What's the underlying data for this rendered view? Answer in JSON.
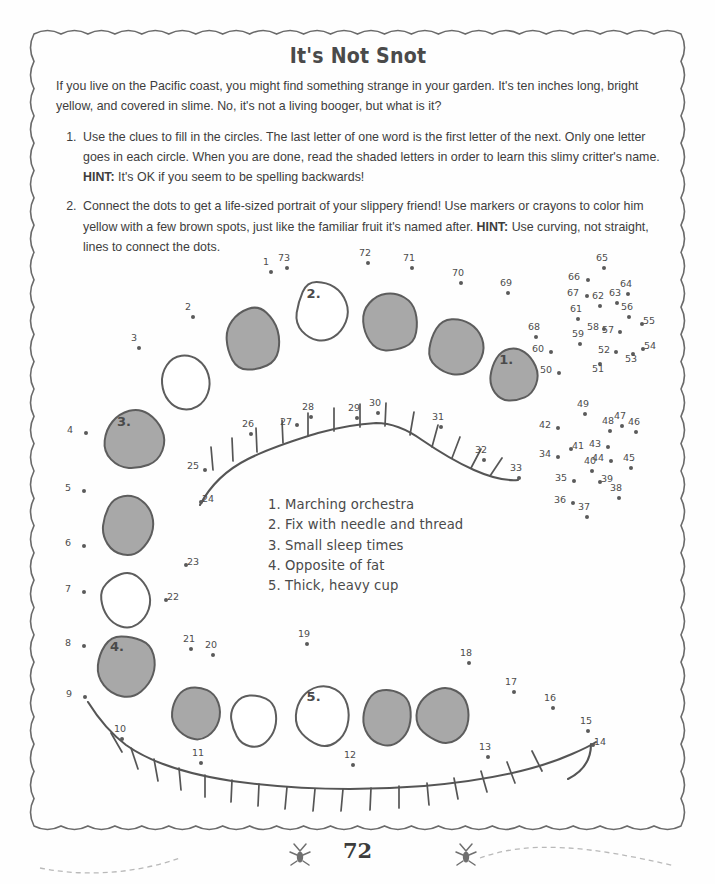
{
  "page": {
    "title": "It's Not Snot",
    "page_number": "72",
    "intro": "If you live on the Pacific coast, you might find something strange in your garden. It's ten inches long, bright yellow, and covered in slime. No, it's not a living booger, but what is it?",
    "instructions": [
      {
        "text_before_hint": "Use the clues to fill in the circles. The last letter of one word is the first letter of the next. Only one letter goes in each circle. When you are done, read the shaded letters in order to learn this slimy critter's name. ",
        "hint_label": "HINT:",
        "text_after_hint": " It's OK if you seem to be spelling backwards!"
      },
      {
        "text_before_hint": "Connect the dots to get a life-sized portrait of your slippery friend! Use markers or crayons to color him yellow with a few brown spots, just like the familiar fruit it's named after. ",
        "hint_label": "HINT:",
        "text_after_hint": " Use curving, not straight, lines to connect the dots."
      }
    ]
  },
  "clues": [
    "1. Marching orchestra",
    "2. Fix with needle and thread",
    "3. Small sleep times",
    "4. Opposite of fat",
    "5. Thick, heavy cup"
  ],
  "colors": {
    "ink": "#4a4a4a",
    "text": "#3d3d3d",
    "shaded_circle_fill": "#a8a8a8",
    "circle_stroke": "#5d5d5d",
    "dot": "#5a5a5a",
    "border": "#6a6a6a"
  },
  "circle_chain": [
    {
      "id": "c-top-1",
      "label": "",
      "shaded": true,
      "cx": 253,
      "cy": 340,
      "rx": 30,
      "ry": 33,
      "rot": -6
    },
    {
      "id": "c-top-2",
      "label": "2.",
      "shaded": false,
      "cx": 322,
      "cy": 312,
      "rx": 28,
      "ry": 33,
      "rot": 4
    },
    {
      "id": "c-top-3",
      "label": "",
      "shaded": true,
      "cx": 391,
      "cy": 322,
      "rx": 30,
      "ry": 32,
      "rot": -3
    },
    {
      "id": "c-top-4",
      "label": "",
      "shaded": true,
      "cx": 457,
      "cy": 348,
      "rx": 29,
      "ry": 31,
      "rot": 6
    },
    {
      "id": "c-top-5",
      "label": "1.",
      "shaded": true,
      "cx": 513,
      "cy": 375,
      "rx": 25,
      "ry": 29,
      "rot": -4
    },
    {
      "id": "c-left-1",
      "label": "",
      "shaded": false,
      "cx": 186,
      "cy": 384,
      "rx": 26,
      "ry": 30,
      "rot": 3
    },
    {
      "id": "c-left-2",
      "label": "3.",
      "shaded": true,
      "cx": 134,
      "cy": 440,
      "rx": 31,
      "ry": 32,
      "rot": -5
    },
    {
      "id": "c-left-3",
      "label": "",
      "shaded": true,
      "cx": 128,
      "cy": 525,
      "rx": 28,
      "ry": 30,
      "rot": 5
    },
    {
      "id": "c-left-4",
      "label": "",
      "shaded": false,
      "cx": 125,
      "cy": 600,
      "rx": 26,
      "ry": 28,
      "rot": -3
    },
    {
      "id": "c-left-5",
      "label": "4.",
      "shaded": true,
      "cx": 127,
      "cy": 665,
      "rx": 31,
      "ry": 32,
      "rot": 4
    },
    {
      "id": "c-bot-1",
      "label": "",
      "shaded": true,
      "cx": 195,
      "cy": 712,
      "rx": 26,
      "ry": 28,
      "rot": -4
    },
    {
      "id": "c-bot-2",
      "label": "",
      "shaded": false,
      "cx": 254,
      "cy": 720,
      "rx": 25,
      "ry": 27,
      "rot": 3
    },
    {
      "id": "c-bot-3",
      "label": "5.",
      "shaded": false,
      "cx": 322,
      "cy": 715,
      "rx": 28,
      "ry": 32,
      "rot": -5
    },
    {
      "id": "c-bot-4",
      "label": "",
      "shaded": true,
      "cx": 387,
      "cy": 717,
      "rx": 27,
      "ry": 29,
      "rot": 4
    },
    {
      "id": "c-bot-5",
      "label": "",
      "shaded": true,
      "cx": 443,
      "cy": 715,
      "rx": 27,
      "ry": 29,
      "rot": -3
    }
  ],
  "dots": [
    {
      "n": "1",
      "x": 271,
      "y": 272,
      "lx": -4,
      "ly": -12
    },
    {
      "n": "2",
      "x": 193,
      "y": 317,
      "lx": -4,
      "ly": -12
    },
    {
      "n": "3",
      "x": 139,
      "y": 348,
      "lx": -4,
      "ly": -12
    },
    {
      "n": "4",
      "x": 86,
      "y": 433,
      "lx": -15,
      "ly": -5
    },
    {
      "n": "5",
      "x": 84,
      "y": 491,
      "lx": -15,
      "ly": -5
    },
    {
      "n": "6",
      "x": 84,
      "y": 546,
      "lx": -15,
      "ly": -5
    },
    {
      "n": "7",
      "x": 84,
      "y": 592,
      "lx": -15,
      "ly": -5
    },
    {
      "n": "8",
      "x": 84,
      "y": 646,
      "lx": -15,
      "ly": -5
    },
    {
      "n": "9",
      "x": 85,
      "y": 697,
      "lx": -15,
      "ly": -5
    },
    {
      "n": "10",
      "x": 122,
      "y": 739,
      "lx": -4,
      "ly": -12
    },
    {
      "n": "11",
      "x": 201,
      "y": 763,
      "lx": -5,
      "ly": -12
    },
    {
      "n": "12",
      "x": 353,
      "y": 765,
      "lx": -5,
      "ly": -12
    },
    {
      "n": "13",
      "x": 488,
      "y": 757,
      "lx": -5,
      "ly": -12
    },
    {
      "n": "14",
      "x": 593,
      "y": 745,
      "lx": 5,
      "ly": -5
    },
    {
      "n": "15",
      "x": 588,
      "y": 731,
      "lx": -4,
      "ly": -12
    },
    {
      "n": "16",
      "x": 553,
      "y": 708,
      "lx": -5,
      "ly": -12
    },
    {
      "n": "17",
      "x": 514,
      "y": 692,
      "lx": -5,
      "ly": -12
    },
    {
      "n": "18",
      "x": 469,
      "y": 663,
      "lx": -5,
      "ly": -12
    },
    {
      "n": "19",
      "x": 307,
      "y": 644,
      "lx": -5,
      "ly": -12
    },
    {
      "n": "20",
      "x": 213,
      "y": 655,
      "lx": -4,
      "ly": -12
    },
    {
      "n": "21",
      "x": 191,
      "y": 649,
      "lx": -4,
      "ly": -12
    },
    {
      "n": "22",
      "x": 166,
      "y": 600,
      "lx": 5,
      "ly": -5
    },
    {
      "n": "23",
      "x": 186,
      "y": 565,
      "lx": 5,
      "ly": -5
    },
    {
      "n": "24",
      "x": 201,
      "y": 502,
      "lx": 5,
      "ly": -5
    },
    {
      "n": "25",
      "x": 205,
      "y": 470,
      "lx": -14,
      "ly": -6
    },
    {
      "n": "26",
      "x": 251,
      "y": 434,
      "lx": -5,
      "ly": -12
    },
    {
      "n": "27",
      "x": 297,
      "y": 425,
      "lx": -13,
      "ly": -5
    },
    {
      "n": "28",
      "x": 311,
      "y": 417,
      "lx": -5,
      "ly": -12
    },
    {
      "n": "29",
      "x": 357,
      "y": 418,
      "lx": -5,
      "ly": -12
    },
    {
      "n": "30",
      "x": 378,
      "y": 413,
      "lx": -5,
      "ly": -12
    },
    {
      "n": "31",
      "x": 441,
      "y": 427,
      "lx": -5,
      "ly": -12
    },
    {
      "n": "32",
      "x": 484,
      "y": 460,
      "lx": -5,
      "ly": -12
    },
    {
      "n": "33",
      "x": 519,
      "y": 478,
      "lx": -5,
      "ly": -12
    },
    {
      "n": "34",
      "x": 558,
      "y": 457,
      "lx": -15,
      "ly": -5
    },
    {
      "n": "35",
      "x": 574,
      "y": 481,
      "lx": -15,
      "ly": -5
    },
    {
      "n": "36",
      "x": 573,
      "y": 503,
      "lx": -15,
      "ly": -5
    },
    {
      "n": "37",
      "x": 587,
      "y": 517,
      "lx": -5,
      "ly": -12
    },
    {
      "n": "38",
      "x": 619,
      "y": 498,
      "lx": -5,
      "ly": -12
    },
    {
      "n": "39",
      "x": 600,
      "y": 482,
      "lx": 5,
      "ly": -5
    },
    {
      "n": "40",
      "x": 592,
      "y": 471,
      "lx": -4,
      "ly": -12
    },
    {
      "n": "41",
      "x": 571,
      "y": 449,
      "lx": 5,
      "ly": -5
    },
    {
      "n": "42",
      "x": 558,
      "y": 428,
      "lx": -15,
      "ly": -5
    },
    {
      "n": "43",
      "x": 608,
      "y": 447,
      "lx": -15,
      "ly": -5
    },
    {
      "n": "44",
      "x": 611,
      "y": 461,
      "lx": -15,
      "ly": -5
    },
    {
      "n": "45",
      "x": 631,
      "y": 468,
      "lx": -4,
      "ly": -12
    },
    {
      "n": "46",
      "x": 636,
      "y": 432,
      "lx": -4,
      "ly": -12
    },
    {
      "n": "47",
      "x": 622,
      "y": 426,
      "lx": -4,
      "ly": -12
    },
    {
      "n": "48",
      "x": 610,
      "y": 431,
      "lx": -4,
      "ly": -12
    },
    {
      "n": "49",
      "x": 585,
      "y": 414,
      "lx": -4,
      "ly": -12
    },
    {
      "n": "50",
      "x": 559,
      "y": 373,
      "lx": -15,
      "ly": -5
    },
    {
      "n": "51",
      "x": 600,
      "y": 364,
      "lx": -4,
      "ly": 3
    },
    {
      "n": "52",
      "x": 616,
      "y": 352,
      "lx": -14,
      "ly": -4
    },
    {
      "n": "53",
      "x": 633,
      "y": 354,
      "lx": -4,
      "ly": 3
    },
    {
      "n": "54",
      "x": 643,
      "y": 349,
      "lx": 5,
      "ly": -5
    },
    {
      "n": "55",
      "x": 642,
      "y": 324,
      "lx": 5,
      "ly": -5
    },
    {
      "n": "56",
      "x": 629,
      "y": 317,
      "lx": -4,
      "ly": -12
    },
    {
      "n": "57",
      "x": 620,
      "y": 332,
      "lx": -14,
      "ly": -4
    },
    {
      "n": "58",
      "x": 604,
      "y": 329,
      "lx": -13,
      "ly": -4
    },
    {
      "n": "59",
      "x": 580,
      "y": 344,
      "lx": -4,
      "ly": -12
    },
    {
      "n": "60",
      "x": 551,
      "y": 352,
      "lx": -15,
      "ly": -5
    },
    {
      "n": "61",
      "x": 578,
      "y": 319,
      "lx": -4,
      "ly": -12
    },
    {
      "n": "62",
      "x": 600,
      "y": 306,
      "lx": -4,
      "ly": -12
    },
    {
      "n": "63",
      "x": 617,
      "y": 303,
      "lx": -4,
      "ly": -12
    },
    {
      "n": "64",
      "x": 628,
      "y": 294,
      "lx": -4,
      "ly": -12
    },
    {
      "n": "65",
      "x": 604,
      "y": 268,
      "lx": -4,
      "ly": -12
    },
    {
      "n": "66",
      "x": 588,
      "y": 280,
      "lx": -16,
      "ly": -5
    },
    {
      "n": "67",
      "x": 587,
      "y": 296,
      "lx": -16,
      "ly": -5
    },
    {
      "n": "68",
      "x": 536,
      "y": 337,
      "lx": -4,
      "ly": -12
    },
    {
      "n": "69",
      "x": 508,
      "y": 293,
      "lx": -4,
      "ly": -12
    },
    {
      "n": "70",
      "x": 461,
      "y": 283,
      "lx": -5,
      "ly": -12
    },
    {
      "n": "71",
      "x": 412,
      "y": 268,
      "lx": -5,
      "ly": -12
    },
    {
      "n": "72",
      "x": 368,
      "y": 263,
      "lx": -5,
      "ly": -12
    },
    {
      "n": "73",
      "x": 287,
      "y": 268,
      "lx": -5,
      "ly": -12
    }
  ]
}
